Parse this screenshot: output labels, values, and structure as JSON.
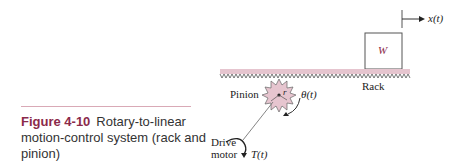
{
  "caption": {
    "figure_number": "Figure 4-10",
    "text": "Rotary-to-linear motion-control system (rack and pinion)"
  },
  "diagram": {
    "labels": {
      "mass": "W",
      "displacement": "x(t)",
      "rack": "Rack",
      "pinion": "Pinion",
      "radius": "r",
      "angle": "θ(t)",
      "motor": "Drive motor",
      "motor_line1": "Drive",
      "motor_line2": "motor",
      "torque": "T(t)"
    },
    "colors": {
      "accent": "#8b2a4a",
      "fill": "#e6c5cf",
      "rule": "#d9a9b6"
    }
  }
}
